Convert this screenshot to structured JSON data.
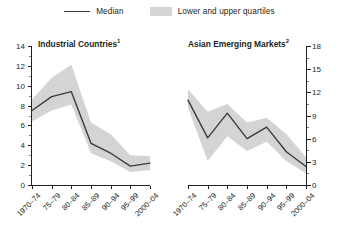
{
  "legend": {
    "items": [
      {
        "name": "median",
        "label": "Median",
        "style": "line",
        "color": "#3b3b3b"
      },
      {
        "name": "quartiles",
        "label": "Lower and upper quartiles",
        "style": "band",
        "color": "#d4d4d4"
      }
    ]
  },
  "colors": {
    "median_line": "#3b3b3b",
    "quartile_band": "#d4d4d4",
    "axis": "#231f20",
    "background": "#ffffff"
  },
  "chart_data": [
    {
      "type": "line",
      "panel": "left",
      "title": "Industrial Countries",
      "title_footnote": "1",
      "xlabel": "",
      "ylabel": "",
      "axis_side": "left",
      "categories": [
        "1970–74",
        "75–79",
        "80–84",
        "85–89",
        "90–94",
        "95–99",
        "2000–04"
      ],
      "ylim": [
        0,
        14
      ],
      "yticks": [
        0,
        2,
        4,
        6,
        8,
        10,
        12,
        14
      ],
      "yticks_minor": [
        1,
        3,
        5,
        7,
        9,
        11,
        13
      ],
      "grid": false,
      "series": [
        {
          "name": "Median",
          "values": [
            7.5,
            8.9,
            9.4,
            4.2,
            3.2,
            1.9,
            2.2
          ]
        },
        {
          "name": "Upper quartile",
          "values": [
            8.6,
            10.8,
            12.1,
            6.3,
            5.1,
            3.0,
            2.9
          ]
        },
        {
          "name": "Lower quartile",
          "values": [
            6.4,
            7.5,
            8.1,
            3.2,
            2.4,
            1.3,
            1.5
          ]
        }
      ]
    },
    {
      "type": "line",
      "panel": "right",
      "title": "Asian Emerging Markets",
      "title_footnote": "2",
      "xlabel": "",
      "ylabel": "",
      "axis_side": "right",
      "categories": [
        "1970–74",
        "75–79",
        "80–84",
        "85–89",
        "90–94",
        "95–99",
        "2000–04"
      ],
      "ylim": [
        0,
        18
      ],
      "yticks": [
        0,
        3,
        6,
        9,
        12,
        15,
        18
      ],
      "yticks_minor": [
        1.5,
        4.5,
        7.5,
        10.5,
        13.5,
        16.5
      ],
      "grid": false,
      "series": [
        {
          "name": "Median",
          "values": [
            11.0,
            6.1,
            9.3,
            6.0,
            7.5,
            4.3,
            2.4
          ]
        },
        {
          "name": "Upper quartile",
          "values": [
            12.4,
            9.5,
            10.5,
            8.1,
            8.7,
            6.6,
            3.6
          ]
        },
        {
          "name": "Lower quartile",
          "values": [
            10.0,
            3.1,
            6.3,
            4.4,
            5.6,
            3.1,
            1.5
          ]
        }
      ]
    }
  ]
}
